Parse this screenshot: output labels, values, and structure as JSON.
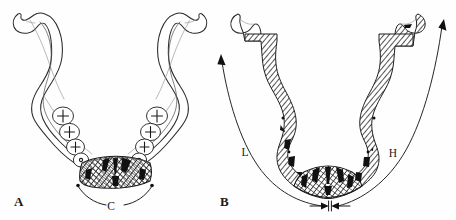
{
  "figure": {
    "caption_visible": false,
    "background_color": "#fefefe",
    "ink_color": "#1a1a1a",
    "panels": [
      {
        "id": "A",
        "label": "A",
        "description": "Mandible occlusal outline view with dentition and hatched symphyseal bone graft donor region",
        "label_position": {
          "x": 18,
          "y": 205
        },
        "annotations": [
          {
            "id": "C",
            "label": "C",
            "type": "bracket-span",
            "description": "Curved bracket spanning the symphyseal region width",
            "label_position": {
              "x": 114,
              "y": 206
            }
          }
        ],
        "teeth": {
          "left_count": 5,
          "right_count": 5,
          "total": 10
        }
      },
      {
        "id": "B",
        "label": "B",
        "description": "Mandible with fully cross-hatched cortical bone and dimensional measurement arcs",
        "label_position": {
          "x": 224,
          "y": 205
        },
        "annotations": [
          {
            "id": "L",
            "label": "L",
            "type": "arc-arrow",
            "description": "Length arc along the left lateral border with arrowhead at superior end",
            "label_position": {
              "x": 247,
              "y": 152
            }
          },
          {
            "id": "H",
            "label": "H",
            "type": "arc-arrow",
            "description": "Height arc along the right lateral border with arrowhead at superior end",
            "label_position": {
              "x": 394,
              "y": 153
            }
          },
          {
            "id": "width-marker",
            "label": "",
            "type": "double-arrow-dimension",
            "description": "Small opposed double-arrow width dimension marker at inferior symphysis",
            "label_position": {
              "x": 330,
              "y": 208
            }
          }
        ]
      }
    ]
  }
}
